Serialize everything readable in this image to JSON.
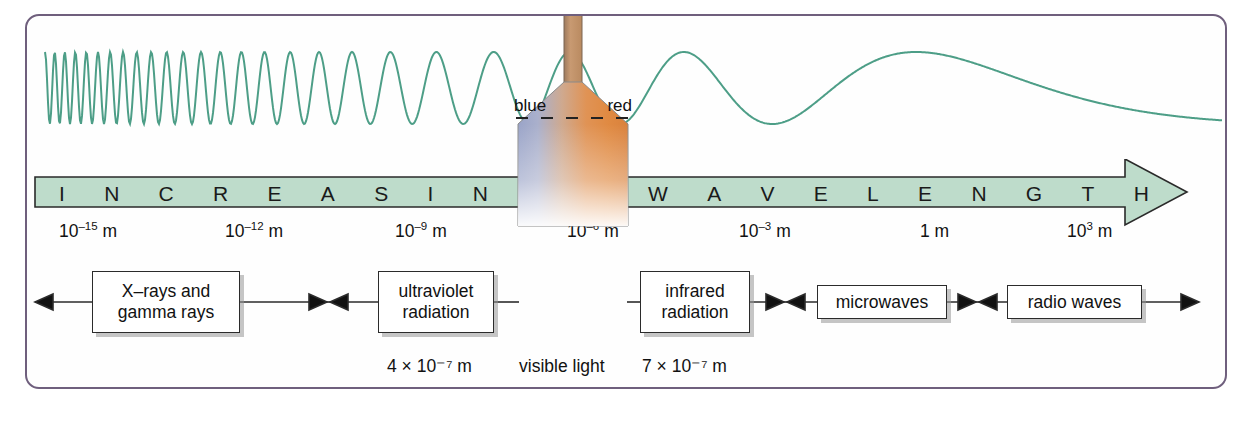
{
  "figure": {
    "border_color": "#6f5f7d",
    "background": "#fefefe"
  },
  "wave": {
    "name": "electromagnetic-wave",
    "color": "#4d9e87",
    "description": "sinusoidal wave with wavelength increasing left to right"
  },
  "arrow": {
    "fill_color": "#bedccb",
    "stroke_color": "#2a2a2a",
    "text": "INCREASING WAVELENGTH",
    "letters": [
      "I",
      "N",
      "C",
      "R",
      "E",
      "A",
      "S",
      "I",
      "N",
      "G",
      "",
      "W",
      "A",
      "V",
      "E",
      "L",
      "E",
      "N",
      "G",
      "T",
      "H"
    ]
  },
  "scale": {
    "unit": "m",
    "ticks": [
      {
        "mantissa": "10",
        "exponent": "–15",
        "unit": "m",
        "label": "10⁻¹⁵ m",
        "x": 32
      },
      {
        "mantissa": "10",
        "exponent": "–12",
        "unit": "m",
        "label": "10⁻¹² m",
        "x": 198
      },
      {
        "mantissa": "10",
        "exponent": "–9",
        "unit": "m",
        "label": "10⁻⁹ m",
        "x": 368
      },
      {
        "mantissa": "10",
        "exponent": "–6",
        "unit": "m",
        "label": "10⁻⁶ m",
        "x": 540
      },
      {
        "mantissa": "10",
        "exponent": "–3",
        "unit": "m",
        "label": "10⁻³ m",
        "x": 712
      },
      {
        "mantissa": "1",
        "exponent": "",
        "unit": "m",
        "label": "1 m",
        "x": 893
      },
      {
        "mantissa": "10",
        "exponent": "3",
        "unit": "m",
        "label": "10³ m",
        "x": 1040
      }
    ]
  },
  "bands": [
    {
      "name": "x-rays-and-gamma-rays",
      "line1": "X–rays and",
      "line2": "gamma rays",
      "x": 65,
      "y": 10,
      "w": 148,
      "h": 62
    },
    {
      "name": "ultraviolet-radiation",
      "line1": "ultraviolet",
      "line2": "radiation",
      "x": 351,
      "y": 10,
      "w": 116,
      "h": 62
    },
    {
      "name": "infrared-radiation",
      "line1": "infrared",
      "line2": "radiation",
      "x": 613,
      "y": 10,
      "w": 110,
      "h": 62
    },
    {
      "name": "microwaves",
      "line1": "microwaves",
      "line2": "",
      "x": 790,
      "y": 24,
      "w": 130,
      "h": 34
    },
    {
      "name": "radio-waves",
      "line1": "radio waves",
      "line2": "",
      "x": 980,
      "y": 24,
      "w": 135,
      "h": 34
    }
  ],
  "visible_light": {
    "name": "visible-light-funnel",
    "blue_label": "blue",
    "red_label": "red",
    "caption": "visible light",
    "lower_bound": "4 × 10⁻⁷ m",
    "upper_bound": "7 × 10⁻⁷ m",
    "gradient_from": "#9aa4c8",
    "gradient_to": "#e08a42",
    "tick_count": 5
  },
  "captions": [
    {
      "name": "visible-lower-bound",
      "text": "4 × 10⁻⁷ m",
      "x": 360
    },
    {
      "name": "visible-light-caption",
      "text": "visible light",
      "x": 492
    },
    {
      "name": "visible-upper-bound",
      "text": "7 × 10⁻⁷ m",
      "x": 615
    }
  ]
}
